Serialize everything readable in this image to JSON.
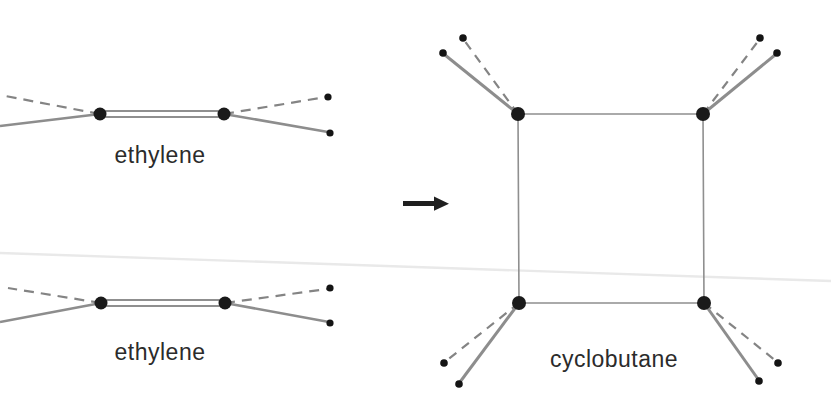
{
  "figure": {
    "type": "chemical-reaction-diagram",
    "reaction_arrow": "→",
    "reactants": [
      {
        "label": "ethylene"
      },
      {
        "label": "ethylene"
      }
    ],
    "product": {
      "label": "cyclobutane"
    },
    "bond_styles": {
      "solid": "C-H bond drawn solid",
      "dashed": "C-H bond drawn dashed",
      "double": "C=C double bond (two parallel lines)",
      "ring": "square ring of four C-C single bonds"
    },
    "colors": {
      "background": "#ffffff",
      "bond": "#8d8d8d",
      "atom": "#1a1a1a",
      "label": "#2b2b2b",
      "arrow": "#1f1f1f",
      "artifact_line": "#e9e9e9"
    }
  }
}
